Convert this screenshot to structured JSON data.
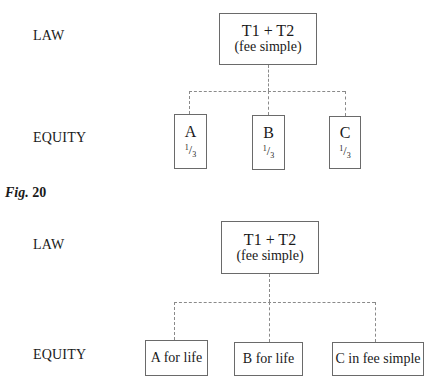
{
  "figure_top": {
    "row_labels": {
      "law": "LAW",
      "equity": "EQUITY"
    },
    "legal_owner": {
      "title": "T1 + T2",
      "subtitle": "(fee simple)"
    },
    "beneficiaries": [
      {
        "name": "A",
        "share_num": "1",
        "share_den": "3"
      },
      {
        "name": "B",
        "share_num": "1",
        "share_den": "3"
      },
      {
        "name": "C",
        "share_num": "1",
        "share_den": "3"
      }
    ]
  },
  "caption": {
    "prefix": "Fig.",
    "number": "20"
  },
  "figure_bottom": {
    "row_labels": {
      "law": "LAW",
      "equity": "EQUITY"
    },
    "legal_owner": {
      "title": "T1 + T2",
      "subtitle": "(fee simple)"
    },
    "beneficiaries": [
      {
        "label": "A for life"
      },
      {
        "label": "B for life"
      },
      {
        "label": "C in fee simple"
      }
    ]
  }
}
